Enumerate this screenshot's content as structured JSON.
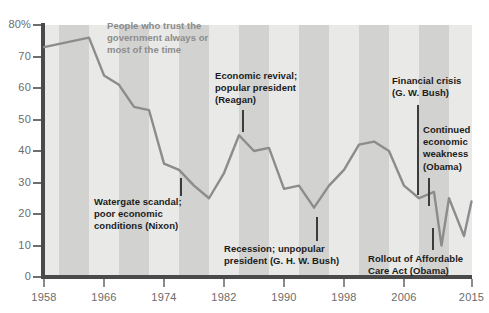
{
  "chart_data": {
    "type": "line",
    "title": "",
    "subtitle": "",
    "xlabel": "",
    "ylabel": "",
    "series_label": "People who trust the government always or most of the time",
    "xlim": [
      1958,
      2015
    ],
    "ylim": [
      0,
      80
    ],
    "grid": false,
    "legend_position": "none",
    "y_ticks": [
      "80%",
      "70",
      "60",
      "50",
      "40",
      "30",
      "20",
      "10",
      "0"
    ],
    "y_tick_values": [
      80,
      70,
      60,
      50,
      40,
      30,
      20,
      10,
      0
    ],
    "x_ticks": [
      "1958",
      "1966",
      "1974",
      "1982",
      "1990",
      "1998",
      "2006",
      "2015"
    ],
    "x_tick_values": [
      1958,
      1966,
      1974,
      1982,
      1990,
      1998,
      2006,
      2015
    ],
    "x": [
      1958,
      1964,
      1966,
      1968,
      1970,
      1972,
      1974,
      1976,
      1978,
      1980,
      1982,
      1984,
      1986,
      1988,
      1990,
      1992,
      1994,
      1996,
      1998,
      2000,
      2002,
      2004,
      2006,
      2008,
      2010,
      2011,
      2012,
      2013,
      2014,
      2015
    ],
    "y": [
      73,
      76,
      64,
      61,
      54,
      53,
      36,
      34,
      29,
      25,
      33,
      45,
      40,
      41,
      28,
      29,
      22,
      29,
      34,
      42,
      43,
      40,
      29,
      25,
      27,
      10,
      25,
      19,
      13,
      24
    ],
    "series_color": "#8c8c8c",
    "plot_background": "#e9e9e7",
    "stripe_color": "#d2d2d0",
    "axis_color": "#4a4a4a",
    "tick_label_color": "#6b6b6b"
  },
  "annotations": [
    {
      "name": "series-caption",
      "text": "People who trust the\ngovernment always or\nmost of the time",
      "x": 107,
      "y": 20,
      "leader": null
    },
    {
      "name": "watergate-nixon",
      "text": "Watergate scandal;\npoor economic\nconditions (Nixon)",
      "x": 94,
      "y": 196,
      "leader": {
        "x": 180,
        "y": 178,
        "height": 18
      }
    },
    {
      "name": "economic-revival-reagan",
      "text": "Economic revival;\npopular president\n(Reagan)",
      "x": 215,
      "y": 70,
      "leader": {
        "x": 242,
        "y": 110,
        "height": 22
      }
    },
    {
      "name": "recession-ghw-bush",
      "text": "Recession; unpopular\npresident (G. H. W. Bush)",
      "x": 224,
      "y": 243,
      "leader": {
        "x": 316,
        "y": 217,
        "height": 24
      }
    },
    {
      "name": "financial-crisis-gw-bush",
      "text": "Financial crisis\n(G. W. Bush)",
      "x": 392,
      "y": 75,
      "leader": {
        "x": 417,
        "y": 105,
        "height": 90
      }
    },
    {
      "name": "continued-economic-weakness-obama",
      "text": "Continued\neconomic\nweakness\n(Obama)",
      "x": 423,
      "y": 124,
      "leader": {
        "x": 428,
        "y": 178,
        "height": 28
      }
    },
    {
      "name": "affordable-care-act-obama",
      "text": "Rollout of Affordable\nCare Act (Obama)",
      "x": 368,
      "y": 253,
      "leader": {
        "x": 432,
        "y": 228,
        "height": 22
      }
    }
  ],
  "stripes": [
    {
      "left": 15,
      "width": 30
    },
    {
      "left": 75,
      "width": 30
    },
    {
      "left": 135,
      "width": 30
    },
    {
      "left": 195,
      "width": 30
    },
    {
      "left": 255,
      "width": 30
    },
    {
      "left": 315,
      "width": 30
    },
    {
      "left": 375,
      "width": 30
    }
  ]
}
